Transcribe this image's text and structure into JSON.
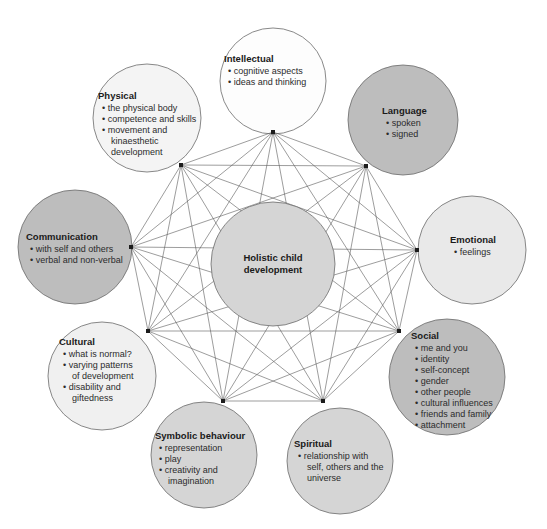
{
  "diagram": {
    "type": "radial-network",
    "center": {
      "id": "center",
      "label_line1": "Holistic child",
      "label_line2": "development",
      "cx": 273,
      "cy": 264,
      "r": 62,
      "fill": "#d5d5d5"
    },
    "colors": {
      "white": "#fdfdfd",
      "very_light_gray": "#f0f0f0",
      "light_gray": "#e6e6e6",
      "mid_gray": "#d5d5d5",
      "dark_gray": "#bdbdbd",
      "stroke": "#6b6b6b",
      "line": "#5a5a5a",
      "text": "#1a1a1a"
    },
    "nodes": [
      {
        "id": "intellectual",
        "title": "Intellectual",
        "bullets": [
          "cognitive aspects",
          "ideas and thinking"
        ],
        "cx": 273,
        "cy": 81,
        "r": 53,
        "fill": "#fdfdfd",
        "hub_x": 273,
        "hub_y": 132,
        "text_x": 224,
        "text_y": 62
      },
      {
        "id": "physical",
        "title": "Physical",
        "bullets": [
          "the physical body",
          "competence and skills",
          "movement and",
          "kinaesthetic",
          "development"
        ],
        "bullet_flags": [
          true,
          true,
          true,
          false,
          false
        ],
        "cx": 147,
        "cy": 118,
        "r": 54,
        "fill": "#f4f4f4",
        "hub_x": 181,
        "hub_y": 165,
        "text_x": 98,
        "text_y": 99
      },
      {
        "id": "language",
        "title": "Language",
        "bullets": [
          "spoken",
          "signed"
        ],
        "cx": 403,
        "cy": 120,
        "r": 55,
        "fill": "#bdbdbd",
        "hub_x": 366,
        "hub_y": 166,
        "text_x": 382,
        "text_y": 114
      },
      {
        "id": "communication",
        "title": "Communication",
        "bullets": [
          "with self and others",
          "verbal and non-verbal"
        ],
        "cx": 75,
        "cy": 247,
        "r": 57,
        "fill": "#bdbdbd",
        "hub_x": 131,
        "hub_y": 247,
        "text_x": 26,
        "text_y": 240
      },
      {
        "id": "emotional",
        "title": "Emotional",
        "bullets": [
          "feelings"
        ],
        "cx": 472,
        "cy": 250,
        "r": 54,
        "fill": "#e9e9e9",
        "hub_x": 417,
        "hub_y": 250,
        "text_x": 450,
        "text_y": 243
      },
      {
        "id": "cultural",
        "title": "Cultural",
        "bullets": [
          "what is normal?",
          "varying patterns",
          "of development",
          "disability and",
          "giftedness"
        ],
        "bullet_flags": [
          true,
          true,
          false,
          true,
          false
        ],
        "cx": 102,
        "cy": 376,
        "r": 54,
        "fill": "#f0f0f0",
        "hub_x": 148,
        "hub_y": 331,
        "text_x": 59,
        "text_y": 345
      },
      {
        "id": "social",
        "title": "Social",
        "bullets": [
          "me and you",
          "identity",
          "self-concept",
          "gender",
          "other people",
          "cultural influences",
          "friends and family",
          "attachment"
        ],
        "cx": 447,
        "cy": 377,
        "r": 58,
        "fill": "#bdbdbd",
        "hub_x": 399,
        "hub_y": 331,
        "text_x": 411,
        "text_y": 339
      },
      {
        "id": "symbolic-behaviour",
        "title": "Symbolic behaviour",
        "bullets": [
          "representation",
          "play",
          "creativity and",
          "imagination"
        ],
        "bullet_flags": [
          true,
          true,
          true,
          false
        ],
        "cx": 204,
        "cy": 455,
        "r": 53,
        "fill": "#d5d5d5",
        "hub_x": 223,
        "hub_y": 401,
        "text_x": 155,
        "text_y": 439
      },
      {
        "id": "spiritual",
        "title": "Spiritual",
        "bullets": [
          "relationship with",
          "self, others and the",
          "universe"
        ],
        "bullet_flags": [
          true,
          false,
          false
        ],
        "cx": 340,
        "cy": 461,
        "r": 53,
        "fill": "#d5d5d5",
        "hub_x": 323,
        "hub_y": 401,
        "text_x": 294,
        "text_y": 447
      }
    ],
    "connections_note": "every hub connects to every other hub"
  }
}
